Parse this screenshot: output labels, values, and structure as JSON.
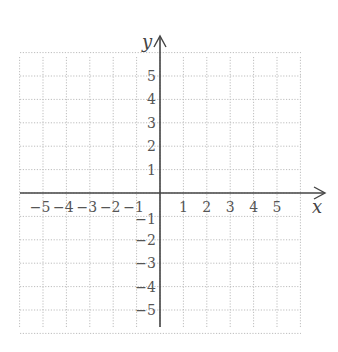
{
  "chart_data": {
    "type": "coordinate-grid",
    "title": "",
    "xlabel": "x",
    "ylabel": "y",
    "xlim": [
      -6,
      6
    ],
    "ylim": [
      -6,
      6
    ],
    "grid": true,
    "grid_style": "dotted",
    "x_ticks": [
      -5,
      -4,
      -3,
      -2,
      -1,
      1,
      2,
      3,
      4,
      5
    ],
    "y_ticks": [
      5,
      4,
      3,
      2,
      1,
      -1,
      -2,
      -3,
      -4,
      -5
    ],
    "x_tick_labels": [
      "−5",
      "−4",
      "−3",
      "−2",
      "−1",
      "1",
      "2",
      "3",
      "4",
      "5"
    ],
    "y_tick_labels": [
      "5",
      "4",
      "3",
      "2",
      "1",
      "−1",
      "−2",
      "−3",
      "−4",
      "−5"
    ],
    "series": []
  },
  "colors": {
    "grid": "#bdbdbd",
    "axis": "#444444",
    "text": "#555555"
  },
  "layout": {
    "origin_px": [
      160,
      193
    ],
    "cell_px": 23.4,
    "grid_left": 20,
    "grid_top": 57,
    "grid_right": 301,
    "grid_bottom": 327,
    "x_arrow_tip": 325,
    "y_arrow_tip": 36
  }
}
